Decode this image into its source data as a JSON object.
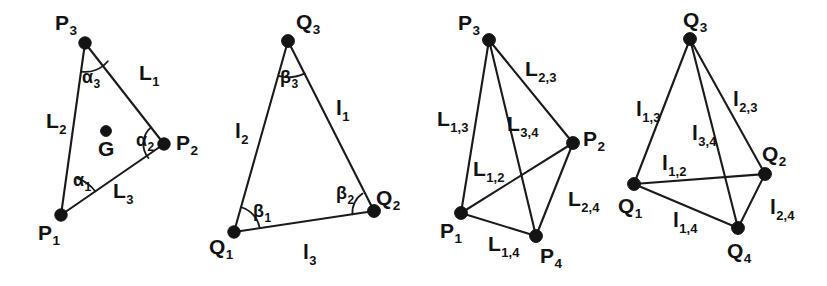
{
  "figure": {
    "background_color": "#ffffff",
    "ink_color": "#141414"
  },
  "panels": [
    {
      "id": "panel-1",
      "name": "triangle-P-with-centroid",
      "vertices": [
        {
          "key": "P1",
          "base": "P",
          "sub": "1",
          "x": 61,
          "y": 215,
          "label_x": 38,
          "label_y": 222
        },
        {
          "key": "P2",
          "base": "P",
          "sub": "2",
          "x": 164,
          "y": 144,
          "label_x": 176,
          "label_y": 132
        },
        {
          "key": "P3",
          "base": "P",
          "sub": "3",
          "x": 85,
          "y": 43,
          "label_x": 55,
          "label_y": 12
        }
      ],
      "centroid": {
        "key": "G",
        "label": "G",
        "x": 106,
        "y": 131,
        "label_x": 98,
        "label_y": 138
      },
      "edges": [
        {
          "key": "L1",
          "from": "P3",
          "to": "P2",
          "base": "L",
          "sub": "1",
          "label_x": 139,
          "label_y": 62
        },
        {
          "key": "L2",
          "from": "P3",
          "to": "P1",
          "base": "L",
          "sub": "2",
          "label_x": 46,
          "label_y": 110
        },
        {
          "key": "L3",
          "from": "P1",
          "to": "P2",
          "base": "L",
          "sub": "3",
          "label_x": 113,
          "label_y": 180
        }
      ],
      "angles": [
        {
          "key": "alpha1",
          "base": "α",
          "sub": "1",
          "at": "P1",
          "label_x": 73,
          "label_y": 171
        },
        {
          "key": "alpha2",
          "base": "α",
          "sub": "2",
          "at": "P2",
          "label_x": 136,
          "label_y": 131
        },
        {
          "key": "alpha3",
          "base": "α",
          "sub": "3",
          "at": "P3",
          "label_x": 82,
          "label_y": 68
        }
      ]
    },
    {
      "id": "panel-2",
      "name": "triangle-Q-with-angles",
      "vertices": [
        {
          "key": "Q1",
          "base": "Q",
          "sub": "1",
          "x": 234,
          "y": 232,
          "label_x": 209,
          "label_y": 236
        },
        {
          "key": "Q2",
          "base": "Q",
          "sub": "2",
          "x": 374,
          "y": 211,
          "label_x": 376,
          "label_y": 187
        },
        {
          "key": "Q3",
          "base": "Q",
          "sub": "3",
          "x": 288,
          "y": 41,
          "label_x": 296,
          "label_y": 11
        }
      ],
      "edges": [
        {
          "key": "l1",
          "from": "Q3",
          "to": "Q2",
          "base": "l",
          "sub": "1",
          "label_x": 336,
          "label_y": 97
        },
        {
          "key": "l2",
          "from": "Q3",
          "to": "Q1",
          "base": "l",
          "sub": "2",
          "label_x": 235,
          "label_y": 120
        },
        {
          "key": "l3",
          "from": "Q1",
          "to": "Q2",
          "base": "l",
          "sub": "3",
          "label_x": 303,
          "label_y": 241
        }
      ],
      "angles": [
        {
          "key": "beta1",
          "base": "β",
          "sub": "1",
          "at": "Q1",
          "label_x": 253,
          "label_y": 202
        },
        {
          "key": "beta2",
          "base": "β",
          "sub": "2",
          "at": "Q2",
          "label_x": 336,
          "label_y": 184
        },
        {
          "key": "beta3",
          "base": "β",
          "sub": "3",
          "at": "Q3",
          "label_x": 280,
          "label_y": 68
        }
      ]
    },
    {
      "id": "panel-3",
      "name": "four-point-network-P",
      "vertices": [
        {
          "key": "P1",
          "base": "P",
          "sub": "1",
          "x": 461,
          "y": 213,
          "label_x": 440,
          "label_y": 220
        },
        {
          "key": "P2",
          "base": "P",
          "sub": "2",
          "x": 573,
          "y": 143,
          "label_x": 583,
          "label_y": 128
        },
        {
          "key": "P3",
          "base": "P",
          "sub": "3",
          "x": 489,
          "y": 40,
          "label_x": 458,
          "label_y": 12
        },
        {
          "key": "P4",
          "base": "P",
          "sub": "4",
          "x": 536,
          "y": 236,
          "label_x": 540,
          "label_y": 245
        }
      ],
      "edges": [
        {
          "key": "L2_3",
          "from": "P3",
          "to": "P2",
          "base": "L",
          "sub": "2,3",
          "label_x": 525,
          "label_y": 58
        },
        {
          "key": "L1_3",
          "from": "P3",
          "to": "P1",
          "base": "L",
          "sub": "1,3",
          "label_x": 437,
          "label_y": 108
        },
        {
          "key": "L3_4",
          "from": "P3",
          "to": "P4",
          "base": "L",
          "sub": "3,4",
          "label_x": 507,
          "label_y": 113
        },
        {
          "key": "L1_2",
          "from": "P1",
          "to": "P2",
          "base": "L",
          "sub": "1,2",
          "label_x": 473,
          "label_y": 158
        },
        {
          "key": "L2_4",
          "from": "P2",
          "to": "P4",
          "base": "L",
          "sub": "2,4",
          "label_x": 568,
          "label_y": 188
        },
        {
          "key": "L1_4",
          "from": "P1",
          "to": "P4",
          "base": "L",
          "sub": "1,4",
          "label_x": 488,
          "label_y": 233
        }
      ]
    },
    {
      "id": "panel-4",
      "name": "four-point-network-Q",
      "vertices": [
        {
          "key": "Q1",
          "base": "Q",
          "sub": "1",
          "x": 634,
          "y": 184,
          "label_x": 618,
          "label_y": 195
        },
        {
          "key": "Q2",
          "base": "Q",
          "sub": "2",
          "x": 765,
          "y": 174,
          "label_x": 762,
          "label_y": 143
        },
        {
          "key": "Q3",
          "base": "Q",
          "sub": "3",
          "x": 690,
          "y": 39,
          "label_x": 683,
          "label_y": 9
        },
        {
          "key": "Q4",
          "base": "Q",
          "sub": "4",
          "x": 738,
          "y": 228,
          "label_x": 727,
          "label_y": 240
        }
      ],
      "edges": [
        {
          "key": "l1_3",
          "from": "Q3",
          "to": "Q1",
          "base": "l",
          "sub": "1,3",
          "label_x": 636,
          "label_y": 98
        },
        {
          "key": "l2_3",
          "from": "Q3",
          "to": "Q2",
          "base": "l",
          "sub": "2,3",
          "label_x": 733,
          "label_y": 88
        },
        {
          "key": "l3_4",
          "from": "Q3",
          "to": "Q4",
          "base": "l",
          "sub": "3,4",
          "label_x": 692,
          "label_y": 122
        },
        {
          "key": "l1_2",
          "from": "Q1",
          "to": "Q2",
          "base": "l",
          "sub": "1,2",
          "label_x": 662,
          "label_y": 152
        },
        {
          "key": "l2_4",
          "from": "Q2",
          "to": "Q4",
          "base": "l",
          "sub": "2,4",
          "label_x": 770,
          "label_y": 196
        },
        {
          "key": "l1_4",
          "from": "Q1",
          "to": "Q4",
          "base": "l",
          "sub": "1,4",
          "label_x": 673,
          "label_y": 209
        }
      ]
    }
  ]
}
